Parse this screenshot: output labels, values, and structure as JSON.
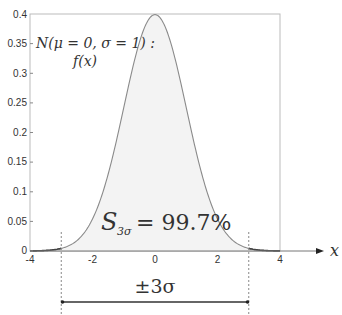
{
  "chart_data": {
    "type": "area",
    "title": "",
    "xlabel": "x",
    "ylabel": "",
    "xlim": [
      -4,
      4
    ],
    "ylim": [
      0,
      0.4
    ],
    "grid": false,
    "legend": "none",
    "x_ticks": [
      "-4",
      "-2",
      "0",
      "2",
      "4"
    ],
    "y_ticks": [
      "0",
      "0.05",
      "0.1",
      "0.15",
      "0.2",
      "0.25",
      "0.3",
      "0.35",
      "0.4"
    ],
    "series": [
      {
        "name": "f(x)",
        "function": "standard normal pdf",
        "mu": 0,
        "sigma": 1,
        "x": [
          -4,
          -3.5,
          -3,
          -2.5,
          -2,
          -1.5,
          -1,
          -0.5,
          0,
          0.5,
          1,
          1.5,
          2,
          2.5,
          3,
          3.5,
          4
        ],
        "values": [
          0.0001,
          0.0009,
          0.0044,
          0.0175,
          0.054,
          0.1295,
          0.242,
          0.3521,
          0.3989,
          0.3521,
          0.242,
          0.1295,
          0.054,
          0.0175,
          0.0044,
          0.0009,
          0.0001
        ]
      }
    ],
    "shaded_region": {
      "from": -3,
      "to": 3,
      "label": "S_3σ = 99.7%"
    },
    "annotations": [
      {
        "text": "N(μ = 0, σ = 1) :",
        "position": "top-left"
      },
      {
        "text": "f(x)",
        "position": "top-left"
      },
      {
        "text": "S_3σ = 99.7%",
        "position": "center-bottom"
      },
      {
        "text": "±3σ",
        "position": "below-axis"
      }
    ],
    "markers": {
      "dashed_verticals": [
        -3,
        3
      ]
    }
  },
  "labels": {
    "dist_name": "N(μ = 0, σ = 1) :",
    "fx": "f(x)",
    "area_S": "S",
    "area_sub": "3σ",
    "area_value": "= 99.7%",
    "range": "±3σ",
    "x_axis": "x"
  },
  "colors": {
    "fill": "#f3f3f3",
    "curve": "#8a8a8a",
    "axis": "#555555",
    "box": "#bbbbbb",
    "text": "#333333"
  }
}
